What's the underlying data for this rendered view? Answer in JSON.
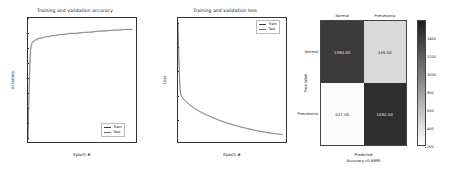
{
  "figure": {
    "background": "#ffffff",
    "panel_count": 3
  },
  "chart_data": [
    {
      "type": "line",
      "id": "accuracy",
      "title": "Training and validation accuracy",
      "xlabel": "Epoch #",
      "ylabel": "Accuracy",
      "xlim": [
        0,
        310
      ],
      "ylim": [
        0.48,
        0.9
      ],
      "grid": false,
      "legend_position": "lower right",
      "xticks": [
        "0",
        "50",
        "100",
        "150",
        "200",
        "250",
        "300"
      ],
      "xtick_values": [
        0,
        50,
        100,
        150,
        200,
        250,
        300
      ],
      "yticks": [
        "0.50",
        "0.55",
        "0.60",
        "0.65",
        "0.70",
        "0.75",
        "0.80",
        "0.85",
        "0.90"
      ],
      "ytick_values": [
        0.5,
        0.55,
        0.6,
        0.65,
        0.7,
        0.75,
        0.8,
        0.85,
        0.9
      ],
      "series": [
        {
          "name": "Train",
          "color": "#3c3c3c",
          "x": [
            0,
            2,
            4,
            6,
            8,
            10,
            14,
            18,
            22,
            26,
            30,
            40,
            50,
            60,
            70,
            80,
            90,
            100,
            120,
            140,
            160,
            180,
            200,
            220,
            240,
            260,
            280,
            300
          ],
          "values": [
            0.487,
            0.585,
            0.686,
            0.757,
            0.793,
            0.808,
            0.818,
            0.823,
            0.826,
            0.829,
            0.831,
            0.834,
            0.836,
            0.838,
            0.84,
            0.842,
            0.843,
            0.845,
            0.847,
            0.849,
            0.851,
            0.853,
            0.855,
            0.857,
            0.858,
            0.86,
            0.861,
            0.862
          ]
        },
        {
          "name": "Test",
          "color": "#6e6e6e",
          "x": [
            0,
            2,
            4,
            6,
            8,
            10,
            14,
            18,
            22,
            26,
            30,
            40,
            50,
            60,
            70,
            80,
            90,
            100,
            120,
            140,
            160,
            180,
            200,
            220,
            240,
            260,
            280,
            300
          ],
          "values": [
            0.487,
            0.6,
            0.704,
            0.775,
            0.806,
            0.816,
            0.822,
            0.82,
            0.828,
            0.824,
            0.832,
            0.83,
            0.838,
            0.835,
            0.842,
            0.839,
            0.845,
            0.843,
            0.849,
            0.846,
            0.852,
            0.85,
            0.856,
            0.854,
            0.859,
            0.857,
            0.862,
            0.86
          ]
        }
      ]
    },
    {
      "type": "line",
      "id": "loss",
      "title": "Training and validation loss",
      "xlabel": "Epoch #",
      "ylabel": "Loss",
      "xlim": [
        0,
        310
      ],
      "ylim": [
        1.0,
        6.2
      ],
      "grid": false,
      "legend_position": "upper right",
      "xticks": [
        "0",
        "50",
        "100",
        "150",
        "200",
        "250",
        "300"
      ],
      "xtick_values": [
        0,
        50,
        100,
        150,
        200,
        250,
        300
      ],
      "yticks": [
        "2",
        "3",
        "4",
        "5",
        "6"
      ],
      "ytick_values": [
        2,
        3,
        4,
        5,
        6
      ],
      "series": [
        {
          "name": "Train",
          "color": "#3c3c3c",
          "x": [
            0,
            2,
            4,
            6,
            8,
            10,
            14,
            18,
            22,
            26,
            30,
            40,
            50,
            60,
            70,
            80,
            90,
            100,
            120,
            140,
            160,
            180,
            200,
            220,
            240,
            260,
            280,
            300
          ],
          "values": [
            6.05,
            4.85,
            3.85,
            3.22,
            3.02,
            2.94,
            2.85,
            2.78,
            2.72,
            2.66,
            2.61,
            2.5,
            2.4,
            2.31,
            2.23,
            2.16,
            2.09,
            2.03,
            1.91,
            1.81,
            1.72,
            1.64,
            1.57,
            1.5,
            1.44,
            1.39,
            1.35,
            1.31
          ]
        },
        {
          "name": "Test",
          "color": "#6e6e6e",
          "x": [
            0,
            2,
            4,
            6,
            8,
            10,
            14,
            18,
            22,
            26,
            30,
            40,
            50,
            60,
            70,
            80,
            90,
            100,
            120,
            140,
            160,
            180,
            200,
            220,
            240,
            260,
            280,
            300
          ],
          "values": [
            6.0,
            4.7,
            3.75,
            3.18,
            2.99,
            2.91,
            2.82,
            2.75,
            2.69,
            2.63,
            2.58,
            2.47,
            2.37,
            2.28,
            2.2,
            2.13,
            2.07,
            2.01,
            1.89,
            1.79,
            1.7,
            1.62,
            1.55,
            1.48,
            1.43,
            1.38,
            1.34,
            1.3
          ]
        }
      ]
    },
    {
      "type": "heatmap",
      "id": "confusion-matrix",
      "title": "",
      "xlabel": "Predicted",
      "ylabel": "True label",
      "subtitle": "Accuracy=0.8995",
      "categories_x": [
        "Normal",
        "Pneumonia"
      ],
      "categories_y": [
        "Normal",
        "Pneumonia"
      ],
      "cells": [
        [
          {
            "value": "1390.00",
            "fill": "#3b3b3b",
            "text_color": "#f2f2f2"
          },
          {
            "value": "339.00",
            "fill": "#d9d9d9",
            "text_color": "#1a1a1a"
          }
        ],
        [
          {
            "value": "247.00",
            "fill": "#fbfbfb",
            "text_color": "#1a1a1a"
          },
          {
            "value": "1592.00",
            "fill": "#2e2e2e",
            "text_color": "#f2f2f2"
          }
        ]
      ],
      "colorbar": {
        "ticks": [
          "1400",
          "1200",
          "1000",
          "800",
          "600",
          "400",
          "200"
        ],
        "tick_values": [
          1400,
          1200,
          1000,
          800,
          600,
          400,
          200
        ],
        "vmin": 200,
        "vmax": 1600,
        "colormap": "grayscale-inverted"
      }
    }
  ]
}
